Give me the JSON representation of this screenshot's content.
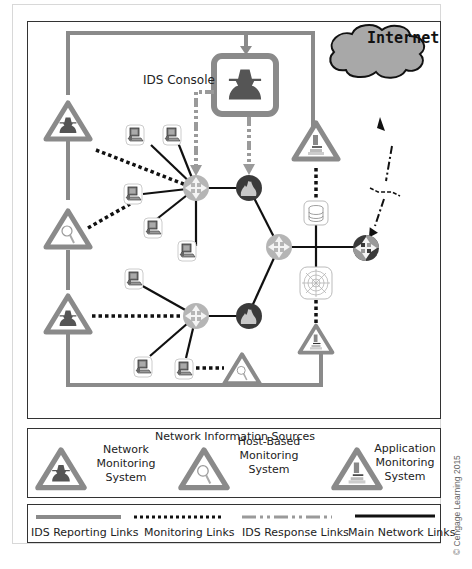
{
  "diagram": {
    "console_label": "IDS Console",
    "internet_label": "Internet",
    "colors": {
      "reporting_link": "#8a8a8a",
      "monitoring_link": "#111111",
      "response_link": "#9a9a9a",
      "main_link": "#111111",
      "router_fill": "#b5b5b5",
      "firewall_fill": "#3a3a3a",
      "cloud_fill": "#a8a8a8"
    },
    "nodes": {
      "ids_console": "IDS Console",
      "routers": [
        "router-upper-left",
        "router-center",
        "router-lower-left",
        "router-edge"
      ],
      "firewalls": [
        "firewall-upper",
        "firewall-lower"
      ],
      "servers": [
        "database-server",
        "web-server"
      ],
      "workstations_count": 9,
      "sensors": [
        "network-monitor-upper",
        "host-monitor-left",
        "network-monitor-lower",
        "application-monitor-upper",
        "application-monitor-lower",
        "host-monitor-bottom"
      ]
    }
  },
  "sources": {
    "title": "Network Information Sources",
    "items": [
      {
        "line1": "Network",
        "line2": "Monitoring",
        "line3": "System",
        "icon": "spy-icon"
      },
      {
        "line1": "Host-Based",
        "line2": "Monitoring",
        "line3": "System",
        "icon": "magnifier-icon"
      },
      {
        "line1": "Application",
        "line2": "Monitoring",
        "line3": "System",
        "icon": "microscope-icon"
      }
    ]
  },
  "legend": {
    "items": [
      {
        "label": "IDS Reporting Links",
        "style": "solid-gray-thick"
      },
      {
        "label": "Monitoring Links",
        "style": "dotted-black"
      },
      {
        "label": "IDS Response Links",
        "style": "dash-dot-gray"
      },
      {
        "label": "Main Network Links",
        "style": "solid-black"
      }
    ]
  },
  "copyright": "© Cengage Learning 2015"
}
